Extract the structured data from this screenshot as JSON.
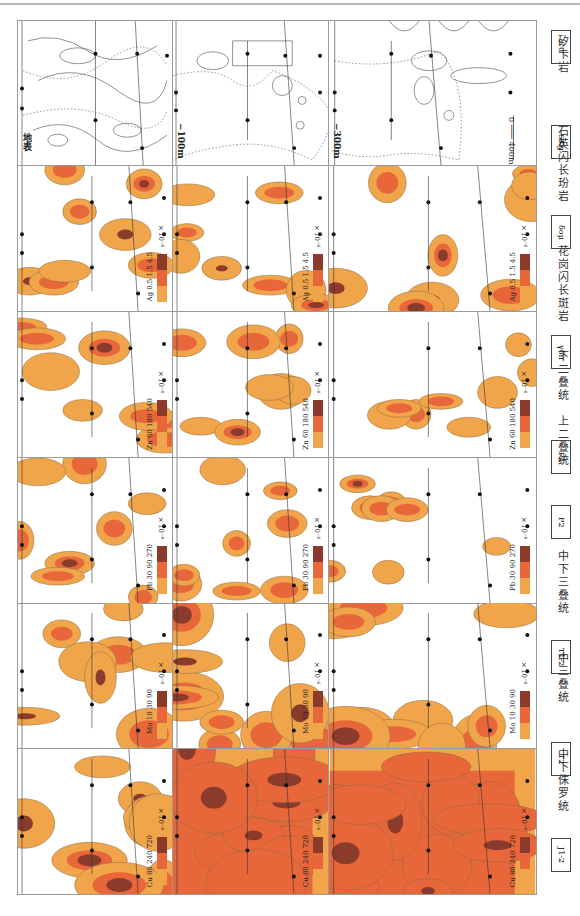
{
  "figure": {
    "orientation": "rotated 90 degrees clockwise",
    "columns": [
      "地表",
      "-100m",
      "-300m"
    ],
    "scale_bar": {
      "start": "0",
      "end": "400m"
    }
  },
  "rows": [
    {
      "id": "geology",
      "label": "地质图",
      "panels": [
        {
          "depth": "地表",
          "drillholes": [
            "1113",
            "708",
            "304",
            "303",
            "1103",
            "1702",
            "1703",
            "704"
          ],
          "units": [
            "T2",
            "T1-2",
            "J1-2",
            "Q",
            "δoμ",
            "γδπ",
            "SKg"
          ]
        },
        {
          "depth": "-100m",
          "drillholes": [
            "1113",
            "708",
            "304",
            "303",
            "1103",
            "1702",
            "1703",
            "704"
          ],
          "units": [
            "T1-2",
            "P1",
            "P2",
            "SKg",
            "γδπ",
            "δoμ"
          ]
        },
        {
          "depth": "-300m",
          "drillholes": [
            "1113",
            "708",
            "304",
            "303",
            "1103",
            "1702",
            "1703",
            "704"
          ],
          "units": [
            "T1-2",
            "P1",
            "P2",
            "Cu",
            "Mo",
            "Pb",
            "Zn",
            "SKg",
            "γδπ",
            "δoμ"
          ]
        }
      ]
    },
    {
      "id": "Ag",
      "element": "Ag",
      "legend": [
        "0.5",
        "1.5",
        "4.5"
      ],
      "unit": "×10⁻⁶"
    },
    {
      "id": "Zn",
      "element": "Zn",
      "legend": [
        "60",
        "180",
        "540"
      ],
      "unit": "×10⁻⁶"
    },
    {
      "id": "Pb",
      "element": "Pb",
      "legend": [
        "30",
        "90",
        "270"
      ],
      "unit": "×10⁻⁶"
    },
    {
      "id": "Mo",
      "element": "Mo",
      "legend": [
        "10",
        "30",
        "90"
      ],
      "unit": "×10⁻⁶"
    },
    {
      "id": "Cu",
      "element": "Cu",
      "legend": [
        "80",
        "240",
        "720"
      ],
      "unit": "×10⁻⁶"
    }
  ],
  "labels": {
    "depth_surface": "地表",
    "depth_100": "−100m",
    "depth_300": "−300m",
    "scale": "0 ─── 400m"
  },
  "colors": {
    "low": "#f1a54b",
    "mid": "#e8673a",
    "high": "#8a3b2b",
    "frame": "#9a9a9a"
  },
  "legend": [
    {
      "symbol": "J1-2",
      "label": "中下侏罗统"
    },
    {
      "symbol": "T2",
      "label": "中三叠统"
    },
    {
      "symbol": "T1-2",
      "label": "中下三叠统"
    },
    {
      "symbol": "P2",
      "label": "上二叠统"
    },
    {
      "symbol": "P1",
      "label": "下二叠统"
    },
    {
      "symbol": "γδπ",
      "label": "花岗闪长斑岩"
    },
    {
      "symbol": "δoμ",
      "label": "石英闪长玢岩"
    },
    {
      "symbol": "SKg",
      "label": "矽卡岩"
    },
    {
      "symbol": "Cu",
      "label": "矿体"
    }
  ]
}
